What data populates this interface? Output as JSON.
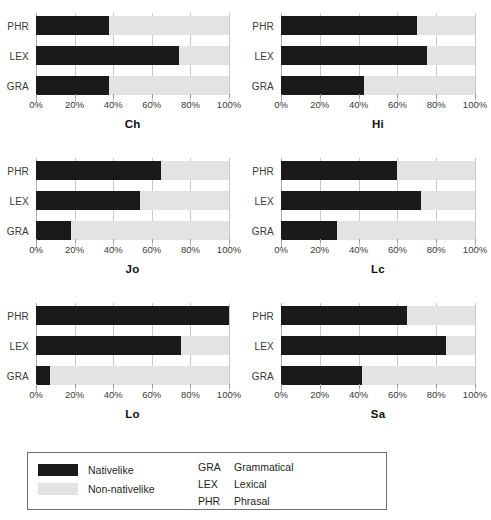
{
  "chart_data": {
    "type": "bar",
    "title": "",
    "subtitle": "",
    "orientation": "horizontal",
    "stacked": true,
    "xlabel": "",
    "ylabel": "",
    "xlim": [
      0,
      100
    ],
    "grid": true,
    "legend_position": "bottom",
    "categories": [
      "PHR",
      "LEX",
      "GRA"
    ],
    "xticks": [
      "0%",
      "20%",
      "40%",
      "60%",
      "80%",
      "100%"
    ],
    "xtick_values": [
      0,
      20,
      40,
      60,
      80,
      100
    ],
    "series": [
      {
        "name": "Nativelike",
        "color": "#1a1a1a"
      },
      {
        "name": "Non-nativelike",
        "color": "#e3e3e3"
      }
    ],
    "panels": [
      {
        "title": "Ch",
        "rows": [
          {
            "label": "PHR",
            "nativelike": 38,
            "non_nativelike": 62
          },
          {
            "label": "LEX",
            "nativelike": 74,
            "non_nativelike": 26
          },
          {
            "label": "GRA",
            "nativelike": 38,
            "non_nativelike": 62
          }
        ]
      },
      {
        "title": "Hi",
        "rows": [
          {
            "label": "PHR",
            "nativelike": 70,
            "non_nativelike": 30
          },
          {
            "label": "LEX",
            "nativelike": 75,
            "non_nativelike": 25
          },
          {
            "label": "GRA",
            "nativelike": 43,
            "non_nativelike": 57
          }
        ]
      },
      {
        "title": "Jo",
        "rows": [
          {
            "label": "PHR",
            "nativelike": 65,
            "non_nativelike": 35
          },
          {
            "label": "LEX",
            "nativelike": 54,
            "non_nativelike": 46
          },
          {
            "label": "GRA",
            "nativelike": 18,
            "non_nativelike": 82
          }
        ]
      },
      {
        "title": "Lc",
        "rows": [
          {
            "label": "PHR",
            "nativelike": 60,
            "non_nativelike": 40
          },
          {
            "label": "LEX",
            "nativelike": 72,
            "non_nativelike": 28
          },
          {
            "label": "GRA",
            "nativelike": 29,
            "non_nativelike": 71
          }
        ]
      },
      {
        "title": "Lo",
        "rows": [
          {
            "label": "PHR",
            "nativelike": 100,
            "non_nativelike": 0
          },
          {
            "label": "LEX",
            "nativelike": 75,
            "non_nativelike": 25
          },
          {
            "label": "GRA",
            "nativelike": 7,
            "non_nativelike": 93
          }
        ]
      },
      {
        "title": "Sa",
        "rows": [
          {
            "label": "PHR",
            "nativelike": 65,
            "non_nativelike": 35
          },
          {
            "label": "LEX",
            "nativelike": 85,
            "non_nativelike": 15
          },
          {
            "label": "GRA",
            "nativelike": 42,
            "non_nativelike": 58
          }
        ]
      }
    ],
    "legend": {
      "swatches": [
        {
          "label": "Nativelike",
          "color": "#1a1a1a"
        },
        {
          "label": "Non-nativelike",
          "color": "#e3e3e3"
        }
      ],
      "abbreviations": [
        {
          "code": "GRA",
          "text": "Grammatical"
        },
        {
          "code": "LEX",
          "text": "Lexical"
        },
        {
          "code": "PHR",
          "text": "Phrasal"
        }
      ]
    }
  },
  "colors": {
    "nativelike": "#1a1a1a",
    "non_nativelike": "#e3e3e3",
    "gridline": "#c9c9c9",
    "text": "#231f20",
    "legend_border": "#6f6f6f"
  }
}
